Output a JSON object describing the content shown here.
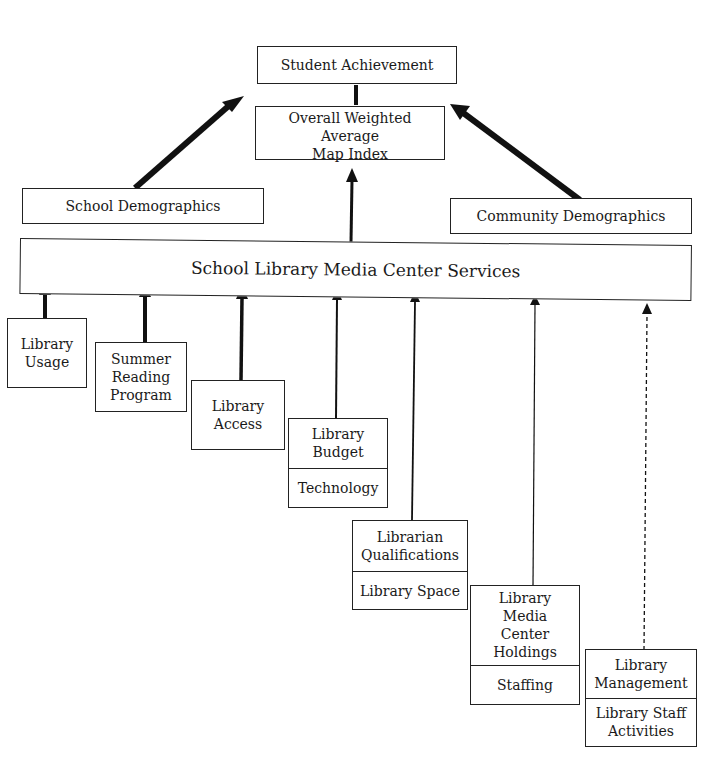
{
  "diagram": {
    "top": {
      "student_achievement": "Student Achievement",
      "map_index": "Overall Weighted Average\nMap Index"
    },
    "demographics": {
      "school": "School Demographics",
      "community": "Community Demographics"
    },
    "services": "School Library Media Center Services",
    "factors": [
      {
        "cells": [
          "Library\nUsage"
        ]
      },
      {
        "cells": [
          "Summer\nReading\nProgram"
        ]
      },
      {
        "cells": [
          "Library\nAccess"
        ]
      },
      {
        "cells": [
          "Library\nBudget",
          "Technology"
        ]
      },
      {
        "cells": [
          "Librarian\nQualifications",
          "Library Space"
        ]
      },
      {
        "cells": [
          "Library\nMedia\nCenter\nHoldings",
          "Staffing"
        ]
      },
      {
        "cells": [
          "Library\nManagement",
          "Library Staff\nActivities"
        ]
      }
    ],
    "arrow_styles": [
      "thick",
      "thick",
      "thick",
      "medium",
      "medium",
      "thin",
      "dashed"
    ]
  }
}
